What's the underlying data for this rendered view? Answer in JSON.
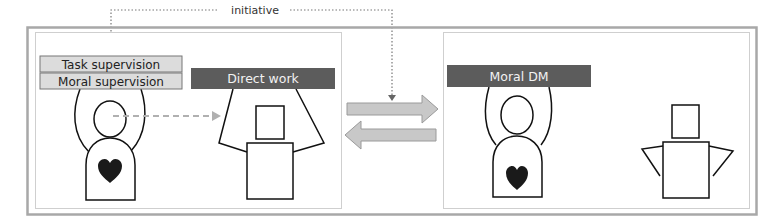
{
  "diagram": {
    "initiative_label": "initiative",
    "left_panel": {
      "labels": {
        "task_supervision": "Task supervision",
        "moral_supervision": "Moral supervision",
        "direct_work": "Direct work"
      }
    },
    "right_panel": {
      "labels": {
        "moral_dm": "Moral DM"
      }
    },
    "colors": {
      "frame": "#a8a8a8",
      "light_box": "#dcdcdc",
      "dark_box": "#5c5c5c",
      "arrow_fill": "#c8c8c8",
      "arrow_stroke": "#9a9a9a",
      "heart": "#1a1a1a",
      "dashed_arrow": "#b0b0b0"
    }
  }
}
